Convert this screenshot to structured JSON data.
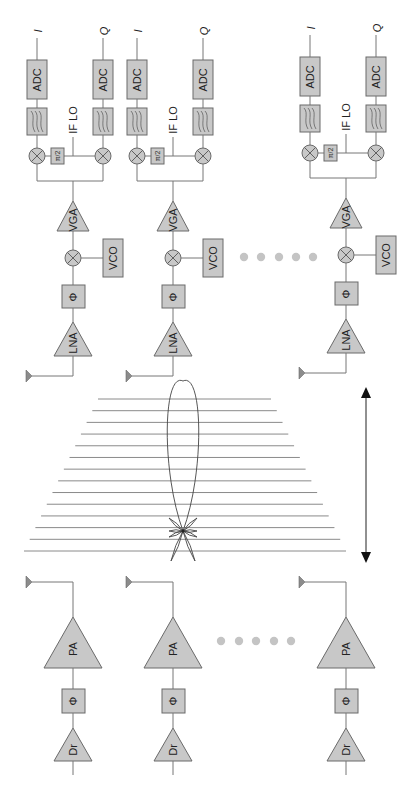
{
  "diagram": {
    "type": "phased-array transceiver block diagram",
    "orientation": "rotated 90 degrees (text reads bottom-to-top)",
    "colors": {
      "block_fill": "#c8c8c8",
      "block_stroke": "#6a6a6a",
      "wire": "#777777",
      "beam_lines": "#8a8a8a",
      "ellipsis_dots": "#c4c4c4",
      "text": "#222222"
    },
    "receiver": {
      "chains": [
        {
          "id": "rx-1",
          "cx": 73,
          "dy": 0
        },
        {
          "id": "rx-2",
          "cx": 173,
          "dy": 0
        },
        {
          "id": "rx-n",
          "cx": 346,
          "dy": -3
        }
      ],
      "labels": {
        "i_output": "I",
        "q_output": "Q",
        "adc": "ADC",
        "if_lo": "IF LO",
        "quadrature_phase": "π/2",
        "vga": "VGA",
        "vco": "VCO",
        "phase_shifter": "Φ",
        "lna": "LNA"
      },
      "ellipsis": {
        "count": 5,
        "y": 257,
        "x": [
          244,
          261,
          279,
          296,
          313
        ]
      }
    },
    "beam": {
      "description": "Main lobe with side lobes over wavefront lines",
      "line_count": 14,
      "scan_arrow": "bidirectional vertical arrow"
    },
    "transmitter": {
      "chains": [
        {
          "id": "tx-1",
          "cx": 73
        },
        {
          "id": "tx-2",
          "cx": 173
        },
        {
          "id": "tx-n",
          "cx": 346
        }
      ],
      "labels": {
        "pa": "PA",
        "phase_shifter": "Φ",
        "driver": "Dr"
      },
      "ellipsis": {
        "count": 5,
        "y": 641,
        "x": [
          221,
          239,
          256,
          274,
          291
        ]
      }
    }
  }
}
